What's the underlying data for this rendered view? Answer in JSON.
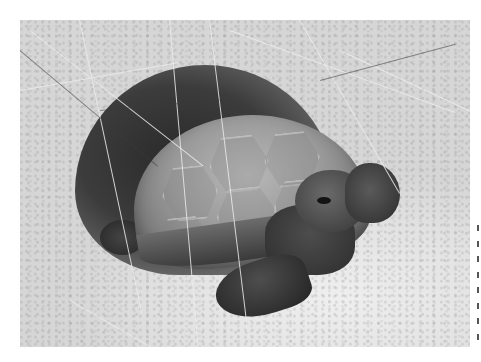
{
  "image": {
    "subject": "gopher tortoise emerging from sandy burrow",
    "style": "grayscale photograph",
    "elements": [
      "burrow",
      "tortoise-shell",
      "tortoise-head",
      "front-leg",
      "dry-grass",
      "sand"
    ]
  },
  "colors": {
    "sand": "#dedede",
    "burrow": "#2a2a2a",
    "shell": "#9a9a9a",
    "skin": "#363636",
    "edge_marks": "#555555"
  },
  "edge_strip": {
    "mark_count": 8
  }
}
